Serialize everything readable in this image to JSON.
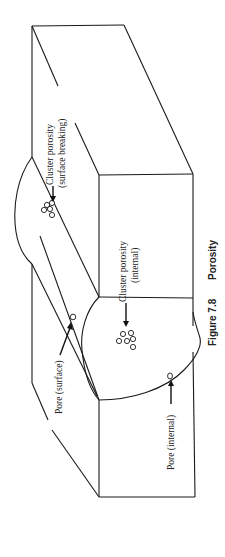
{
  "figure": {
    "number": "Figure 7.8",
    "title": "Porosity",
    "orientation": "rotated 90° counter-clockwise (text reads bottom-to-top)"
  },
  "labels": {
    "cluster_surface_line1": "Cluster porosity",
    "cluster_surface_line2": "(surface breaking)",
    "cluster_internal_line1": "Cluster porosity",
    "cluster_internal_line2": "(internal)",
    "pore_surface": "Pore (surface)",
    "pore_internal": "Pore (internal)"
  },
  "colors": {
    "line": "#1a1a1a",
    "background": "#ffffff"
  }
}
